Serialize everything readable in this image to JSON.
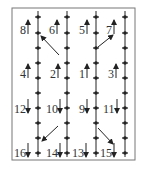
{
  "diagram": {
    "frame": {
      "x": 12,
      "y": 8,
      "w": 123,
      "h": 152,
      "stroke": "#777777"
    },
    "columns_x": [
      38,
      67,
      96,
      125
    ],
    "rows_y": [
      17,
      33,
      48,
      63,
      78,
      93,
      108,
      123,
      138,
      153
    ],
    "line_color": "#222222",
    "labels": [
      {
        "text": "8",
        "x": 20,
        "y": 34,
        "dir": "up"
      },
      {
        "text": "6",
        "x": 49,
        "y": 34,
        "dir": "up"
      },
      {
        "text": "5",
        "x": 79,
        "y": 34,
        "dir": "up"
      },
      {
        "text": "7",
        "x": 106,
        "y": 34,
        "dir": "up"
      },
      {
        "text": "4",
        "x": 20,
        "y": 78,
        "dir": "up"
      },
      {
        "text": "2",
        "x": 50,
        "y": 78,
        "dir": "up"
      },
      {
        "text": "1",
        "x": 79,
        "y": 78,
        "dir": "up"
      },
      {
        "text": "3",
        "x": 108,
        "y": 78,
        "dir": "up"
      },
      {
        "text": "12",
        "x": 14,
        "y": 113,
        "dir": "down"
      },
      {
        "text": "10",
        "x": 46,
        "y": 113,
        "dir": "down"
      },
      {
        "text": "9",
        "x": 79,
        "y": 113,
        "dir": "down"
      },
      {
        "text": "11",
        "x": 103,
        "y": 113,
        "dir": "down"
      },
      {
        "text": "16",
        "x": 14,
        "y": 157,
        "dir": "down"
      },
      {
        "text": "14",
        "x": 46,
        "y": 157,
        "dir": "down"
      },
      {
        "text": "13",
        "x": 72,
        "y": 157,
        "dir": "down"
      },
      {
        "text": "15",
        "x": 100,
        "y": 157,
        "dir": "down"
      }
    ],
    "arrows": [
      {
        "from": [
          59,
          55
        ],
        "to": [
          41,
          36
        ]
      },
      {
        "from": [
          98,
          47
        ],
        "to": [
          113,
          35
        ]
      },
      {
        "from": [
          58,
          126
        ],
        "to": [
          42,
          141
        ]
      },
      {
        "from": [
          98,
          128
        ],
        "to": [
          113,
          144
        ]
      }
    ]
  }
}
